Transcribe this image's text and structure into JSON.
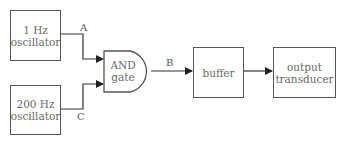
{
  "diagram": {
    "blocks": {
      "osc1": {
        "line1": "1 Hz",
        "line2": "oscillator"
      },
      "osc200": {
        "line1": "200 Hz",
        "line2": "oscillator"
      },
      "and_gate": {
        "line1": "AND",
        "line2": "gate"
      },
      "buffer": {
        "label": "buffer"
      },
      "transducer": {
        "line1": "output",
        "line2": "transducer"
      }
    },
    "signals": {
      "a": "A",
      "b": "B",
      "c": "C"
    },
    "colors": {
      "line": "#333333",
      "box_border": "#555555",
      "text": "#6a6a6a"
    }
  }
}
